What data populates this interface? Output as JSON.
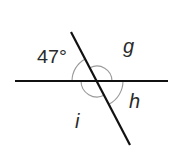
{
  "diagram": {
    "type": "intersecting-lines-angles",
    "intersection": {
      "x": 97,
      "y": 81
    },
    "lines": [
      {
        "name": "horizontal-line",
        "x1": 15,
        "y1": 81,
        "x2": 168,
        "y2": 81
      },
      {
        "name": "transversal-line",
        "x1": 71,
        "y1": 32,
        "x2": 130,
        "y2": 145
      }
    ],
    "labels": {
      "given_angle": "47°",
      "angle_g": "g",
      "angle_h": "h",
      "angle_i": "i"
    },
    "colors": {
      "line": "#111111",
      "arc": "#9a9a9a",
      "text": "#2a2a2a"
    }
  }
}
